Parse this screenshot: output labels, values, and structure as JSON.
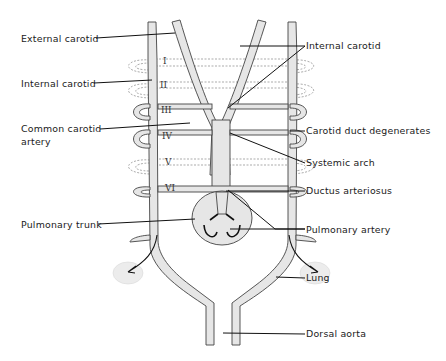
{
  "diagram": {
    "arch_numerals": [
      "I",
      "II",
      "III",
      "IV",
      "V",
      "VI"
    ],
    "labels_left": [
      {
        "text": "External carotid"
      },
      {
        "text": "Internal carotid"
      },
      {
        "text": "Common carotid"
      },
      {
        "text": "artery"
      },
      {
        "text": "Pulmonary trunk"
      }
    ],
    "labels_right": [
      {
        "text": "Internal carotid"
      },
      {
        "text": "Carotid duct degenerates"
      },
      {
        "text": "Systemic arch"
      },
      {
        "text": "Ductus arteriosus"
      },
      {
        "text": "Pulmonary artery"
      },
      {
        "text": "Lung"
      },
      {
        "text": "Dorsal aorta"
      }
    ],
    "colors": {
      "vessel_fill": "#e6e6e6",
      "outline": "#444444",
      "text": "#1a1a1a"
    }
  }
}
